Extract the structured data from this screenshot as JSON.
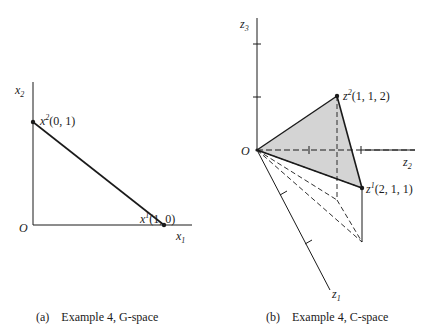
{
  "panel_a": {
    "caption": "(a)    Example 4, G-space",
    "origin_label": "O",
    "x_axis_label": "x",
    "x_axis_sub": "1",
    "y_axis_label": "x",
    "y_axis_sub": "2",
    "points": [
      {
        "name": "x",
        "sup": "2",
        "coords": "(0, 1)"
      },
      {
        "name": "x",
        "sup": "1",
        "coords": "(1, 0)"
      }
    ]
  },
  "panel_b": {
    "caption": "(b)    Example 4, C-space",
    "origin_label": "O",
    "axes": [
      {
        "label": "z",
        "sub": "3"
      },
      {
        "label": "z",
        "sub": "2"
      },
      {
        "label": "z",
        "sub": "1"
      }
    ],
    "points": [
      {
        "name": "z",
        "sup": "2",
        "coords": "(1, 1, 2)"
      },
      {
        "name": "z",
        "sup": "1",
        "coords": "(2, 1, 1)"
      }
    ],
    "fill_color": "#d4d4d4"
  },
  "colors": {
    "line": "#1a1a1a",
    "shade": "#d4d4d4"
  }
}
